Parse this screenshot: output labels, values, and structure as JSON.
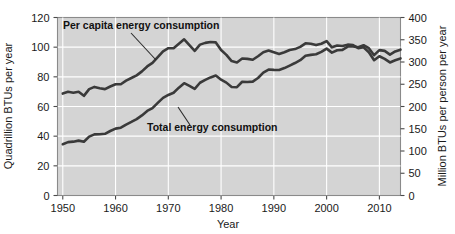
{
  "chart_data": {
    "type": "line",
    "title": "",
    "xlabel": "Year",
    "ylabel": "Quadrillion BTUs per year",
    "ylabel_right": "Million BTUs per person per year",
    "xlim": [
      1949,
      2014
    ],
    "ylim": [
      0,
      120
    ],
    "ylim_right": [
      0,
      400
    ],
    "xticks": [
      1950,
      1960,
      1970,
      1980,
      1990,
      2000,
      2010
    ],
    "xticklabels": [
      "1950",
      "1960",
      "1970",
      "1980",
      "1990",
      "2000",
      "2010"
    ],
    "yticks": [
      0,
      20,
      40,
      60,
      80,
      100,
      120
    ],
    "yticklabels": [
      "0",
      "20",
      "40",
      "60",
      "80",
      "100",
      "120"
    ],
    "yticks_right": [
      0,
      50,
      100,
      150,
      200,
      250,
      300,
      350,
      400
    ],
    "yticklabels_right": [
      "0",
      "50",
      "100",
      "150",
      "200",
      "250",
      "300",
      "350",
      "400"
    ],
    "grid": true,
    "grid_color": "#ffffff",
    "plot_bg": "#d4d4d4",
    "line_color": "#3a3a3a",
    "legend_position": "inline-annotations",
    "annotations": [
      {
        "text": "Per capita energy consumption",
        "series": "per_capita"
      },
      {
        "text": "Total energy consumption",
        "series": "total"
      }
    ],
    "series": [
      {
        "name": "Per capita energy consumption",
        "axis": "right",
        "units": "Million BTUs per person per year",
        "x": [
          1950,
          1951,
          1952,
          1953,
          1954,
          1955,
          1956,
          1957,
          1958,
          1959,
          1960,
          1961,
          1962,
          1963,
          1964,
          1965,
          1966,
          1967,
          1968,
          1969,
          1970,
          1971,
          1972,
          1973,
          1974,
          1975,
          1976,
          1977,
          1978,
          1979,
          1980,
          1981,
          1982,
          1983,
          1984,
          1985,
          1986,
          1987,
          1988,
          1989,
          1990,
          1991,
          1992,
          1993,
          1994,
          1995,
          1996,
          1997,
          1998,
          1999,
          2000,
          2001,
          2002,
          2003,
          2004,
          2005,
          2006,
          2007,
          2008,
          2009,
          2010,
          2011,
          2012,
          2013,
          2014
        ],
        "values": [
          229,
          233,
          231,
          233,
          224,
          239,
          244,
          241,
          239,
          245,
          250,
          250,
          258,
          264,
          270,
          279,
          290,
          298,
          311,
          324,
          331,
          331,
          341,
          351,
          338,
          325,
          339,
          343,
          345,
          344,
          327,
          316,
          302,
          299,
          308,
          307,
          305,
          313,
          322,
          326,
          322,
          318,
          322,
          327,
          329,
          334,
          342,
          341,
          338,
          341,
          347,
          333,
          337,
          336,
          339,
          338,
          331,
          333,
          322,
          304,
          313,
          307,
          299,
          304,
          308
        ]
      },
      {
        "name": "Total energy consumption",
        "axis": "left",
        "units": "Quadrillion BTUs per year",
        "x": [
          1950,
          1951,
          1952,
          1953,
          1954,
          1955,
          1956,
          1957,
          1958,
          1959,
          1960,
          1961,
          1962,
          1963,
          1964,
          1965,
          1966,
          1967,
          1968,
          1969,
          1970,
          1971,
          1972,
          1973,
          1974,
          1975,
          1976,
          1977,
          1978,
          1979,
          1980,
          1981,
          1982,
          1983,
          1984,
          1985,
          1986,
          1987,
          1988,
          1989,
          1990,
          1991,
          1992,
          1993,
          1994,
          1995,
          1996,
          1997,
          1998,
          1999,
          2000,
          2001,
          2002,
          2003,
          2004,
          2005,
          2006,
          2007,
          2008,
          2009,
          2010,
          2011,
          2012,
          2013,
          2014
        ],
        "values": [
          34.6,
          36.0,
          36.3,
          37.0,
          36.2,
          39.7,
          41.2,
          41.3,
          41.6,
          43.5,
          45.1,
          45.7,
          47.8,
          49.6,
          51.5,
          54.0,
          57.0,
          58.9,
          62.4,
          65.8,
          67.8,
          69.3,
          72.7,
          75.7,
          73.9,
          71.9,
          76.0,
          77.9,
          79.6,
          80.9,
          78.1,
          76.1,
          73.1,
          73.0,
          76.7,
          76.5,
          76.8,
          79.2,
          82.8,
          84.9,
          84.7,
          84.6,
          85.9,
          87.6,
          89.3,
          91.2,
          94.2,
          94.8,
          95.2,
          96.8,
          99.0,
          96.3,
          97.9,
          98.2,
          100.4,
          100.5,
          99.9,
          101.3,
          99.3,
          94.6,
          98.0,
          97.5,
          95.0,
          97.1,
          98.3
        ]
      }
    ]
  },
  "axes": {
    "left_label": "Quadrillion BTUs per year",
    "right_label": "Million BTUs per person per year",
    "x_label": "Year"
  },
  "annotations": {
    "per_capita_label": "Per capita energy consumption",
    "total_label": "Total energy consumption"
  },
  "colors": {
    "line": "#3a3a3a",
    "plot_background": "#d4d4d4",
    "grid": "#ffffff",
    "text": "#1a1a1a"
  }
}
